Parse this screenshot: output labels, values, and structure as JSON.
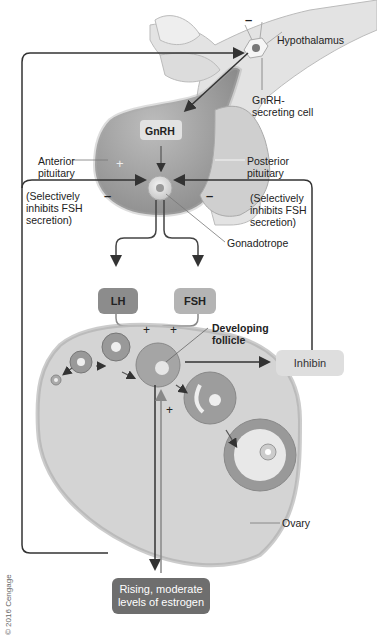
{
  "labels": {
    "hypothalamus": "Hypothalamus",
    "gnrh_cell": [
      "GnRH-",
      "secreting cell"
    ],
    "gnrh": "GnRH",
    "anterior_pituitary": [
      "Anterior",
      "pituitary"
    ],
    "posterior_pituitary": [
      "Posterior",
      "pituitary"
    ],
    "selective_left": [
      "(Selectively",
      "inhibits FSH",
      "secretion)"
    ],
    "selective_right": [
      "(Selectively",
      "inhibits FSH",
      "secretion)"
    ],
    "gonadotrope": "Gonadotrope",
    "lh": "LH",
    "fsh": "FSH",
    "developing_follicle": [
      "Developing",
      "follicle"
    ],
    "inhibin": "Inhibin",
    "ovary": "Ovary",
    "estrogen": [
      "Rising, moderate",
      "levels of estrogen"
    ],
    "copyright": "© 2016 Cengage"
  },
  "signs": {
    "plus": "+",
    "minus": "–"
  },
  "colors": {
    "line": "#333333",
    "tissue_dark": "#9a9a9a",
    "tissue_light": "#d6d6d6",
    "lh_box": "#8c8c8c",
    "fsh_box": "#b4b4b4",
    "inhibin_box": "#dedede",
    "estrogen_box": "#6e6e6e",
    "ovary_fill": "#d4d4d4"
  }
}
